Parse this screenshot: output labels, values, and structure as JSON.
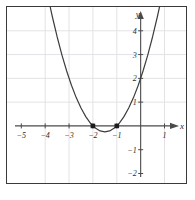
{
  "figure": {
    "frame_color": "#3a3a3a",
    "background": "#ffffff"
  },
  "chart_data": {
    "type": "line",
    "title": "",
    "subtitle": "",
    "xlabel": "x",
    "ylabel": "y",
    "equation": "y = x^2 + 3x + 2",
    "xlim": [
      -5.6,
      1.9
    ],
    "ylim": [
      -2.4,
      5.0
    ],
    "grid": true,
    "grid_color": "#e3e3e7",
    "curve_color": "#3d3d3d",
    "axis_color": "#4a4a4a",
    "legend": null,
    "legend_position": "none",
    "x_ticks": [
      -5,
      -4,
      -3,
      -2,
      -1,
      1
    ],
    "x_tick_labels": [
      "−5",
      "−4",
      "−3",
      "−2",
      "−1",
      "1"
    ],
    "y_ticks": [
      -2,
      -1,
      1,
      2,
      3,
      4
    ],
    "y_tick_labels": [
      "−2",
      "−1",
      "1",
      "2",
      "3",
      "4"
    ],
    "x_axis_arrow": true,
    "y_axis_arrow": true,
    "series": [
      {
        "name": "parabola",
        "type": "line",
        "x": [
          -4.3,
          -4.1,
          -3.9,
          -3.7,
          -3.5,
          -3.3,
          -3.1,
          -2.9,
          -2.7,
          -2.5,
          -2.3,
          -2.1,
          -1.9,
          -1.7,
          -1.5,
          -1.3,
          -1.1,
          -0.9,
          -0.7,
          -0.5,
          -0.3,
          -0.1,
          0.1,
          0.3,
          0.5,
          0.7,
          0.9,
          1.05
        ],
        "y": [
          7.59,
          6.51,
          5.51,
          4.59,
          3.75,
          2.99,
          2.31,
          1.71,
          1.19,
          0.75,
          0.39,
          0.11,
          -0.09,
          -0.21,
          -0.25,
          -0.21,
          -0.09,
          0.11,
          0.39,
          0.75,
          1.19,
          1.71,
          2.31,
          2.99,
          3.75,
          4.59,
          5.51,
          6.25
        ]
      }
    ],
    "markers": [
      {
        "name": "root-left",
        "x": -2,
        "y": 0,
        "shape": "square",
        "color": "#1c1c1c"
      },
      {
        "name": "root-right",
        "x": -1,
        "y": 0,
        "shape": "square",
        "color": "#1c1c1c"
      }
    ],
    "vertical_gridlines_x": [
      -4,
      -3,
      -2,
      -1,
      1
    ],
    "horizontal_gridlines_y": [
      1,
      2,
      3,
      4
    ]
  }
}
